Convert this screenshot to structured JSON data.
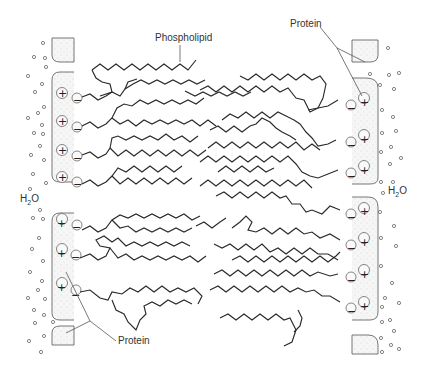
{
  "diagram": {
    "labels": {
      "phospholipid": "Phospholipid",
      "protein_top": "Protein",
      "protein_bottom": "Protein",
      "water_left": "H2O",
      "water_right": "H2O"
    },
    "charges": {
      "plus": "+",
      "minus": "−"
    },
    "colors": {
      "background": "#ffffff",
      "line": "#2a2a2a",
      "protein_fill": "#f3f3f3",
      "label_text": "#333333"
    },
    "rows_per_side": 8
  }
}
